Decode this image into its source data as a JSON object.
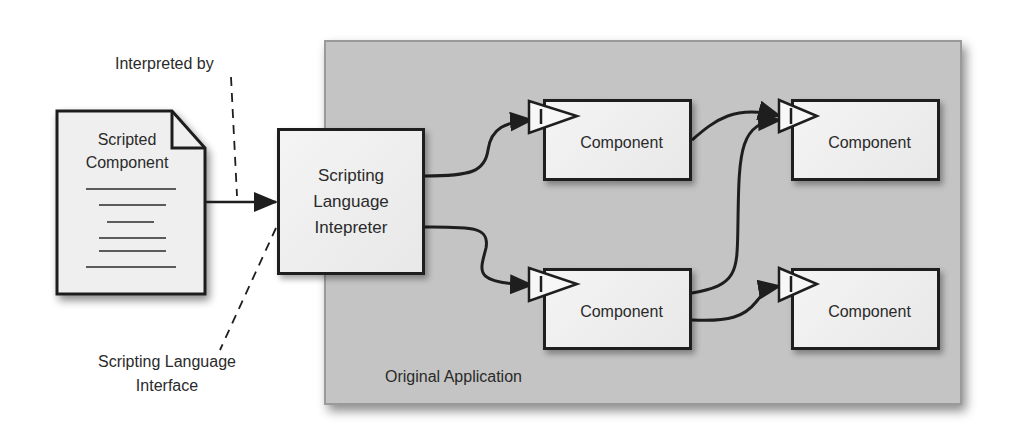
{
  "diagram": {
    "colors": {
      "panel_fill": "#c4c4c4",
      "box_fill": "#eeeeee",
      "stroke": "#1e1e1e",
      "text": "#2a2a2a",
      "background": "#ffffff"
    },
    "document": {
      "label_line1": "Scripted",
      "label_line2": "Component",
      "icon": "document-icon",
      "text_lines": 6
    },
    "callouts": {
      "interpreted_by": "Interpreted by",
      "interface_line1": "Scripting Language",
      "interface_line2": "Interface"
    },
    "interpreter": {
      "line1": "Scripting",
      "line2": "Language",
      "line3": "Intepreter"
    },
    "application": {
      "label": "Original Application",
      "components": [
        {
          "id": "component-top-left",
          "label": "Component",
          "port_icon": "input-port-triangle-icon"
        },
        {
          "id": "component-top-right",
          "label": "Component",
          "port_icon": "input-port-triangle-icon"
        },
        {
          "id": "component-bottom-left",
          "label": "Component",
          "port_icon": "input-port-triangle-icon"
        },
        {
          "id": "component-bottom-right",
          "label": "Component",
          "port_icon": "input-port-triangle-icon"
        }
      ]
    },
    "connections": [
      {
        "from": "Scripted Component",
        "to": "Scripting Language Intepreter",
        "style": "solid-arrow"
      },
      {
        "from": "Scripting Language Intepreter",
        "to": "component-top-left",
        "style": "curved-arrow"
      },
      {
        "from": "Scripting Language Intepreter",
        "to": "component-bottom-left",
        "style": "curved-arrow"
      },
      {
        "from": "component-top-left",
        "to": "component-top-right",
        "style": "curved-arrow"
      },
      {
        "from": "component-bottom-left",
        "to": "component-top-right",
        "style": "curved-arrow"
      },
      {
        "from": "component-bottom-left",
        "to": "component-bottom-right",
        "style": "curved-arrow"
      },
      {
        "from": "Interpreted by",
        "to": "document-to-interpreter-arrow",
        "style": "dashed-leader"
      },
      {
        "from": "Scripting Language Interface",
        "to": "interpreter-left-edge",
        "style": "dashed-leader"
      }
    ]
  }
}
